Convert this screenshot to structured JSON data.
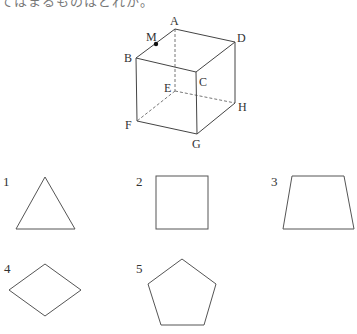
{
  "header": {
    "clipped_text": "てはまるものはどれか。"
  },
  "cube": {
    "labels": {
      "A": "A",
      "B": "B",
      "C": "C",
      "D": "D",
      "E": "E",
      "F": "F",
      "G": "G",
      "H": "H",
      "M": "M"
    }
  },
  "options": [
    {
      "number": "1",
      "shape": "triangle"
    },
    {
      "number": "2",
      "shape": "square"
    },
    {
      "number": "3",
      "shape": "trapezoid"
    },
    {
      "number": "4",
      "shape": "rhombus"
    },
    {
      "number": "5",
      "shape": "pentagon"
    }
  ]
}
